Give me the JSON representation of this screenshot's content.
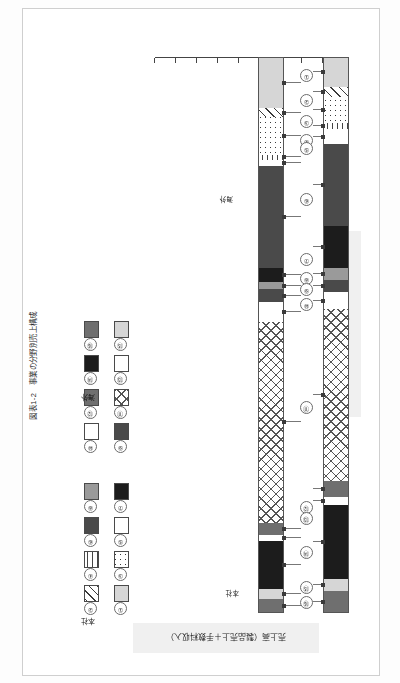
{
  "figure": {
    "caption": "図表1-2　事業の分野別売上構成",
    "axis_sales_label": "売上高（製品売上＋手数料収入）",
    "axis_employees_label": "従業員数"
  },
  "legend": {
    "group_headcourt_label": "本社",
    "group_overseas_label": "海外",
    "items": [
      {
        "num": "①",
        "pattern": "f-solidlight"
      },
      {
        "num": "②",
        "pattern": "f-diag"
      },
      {
        "num": "③",
        "pattern": "f-dots"
      },
      {
        "num": "④",
        "pattern": "f-hatchv"
      },
      {
        "num": "⑤",
        "pattern": "f-white"
      },
      {
        "num": "⑥",
        "pattern": "f-darkgray"
      },
      {
        "num": "⑦",
        "pattern": "f-solidblack"
      },
      {
        "num": "⑧",
        "pattern": "f-solidmid"
      },
      {
        "num": "⑨",
        "pattern": "f-darkgray"
      },
      {
        "num": "⑩",
        "pattern": "f-white"
      },
      {
        "num": "⑪",
        "pattern": "f-cross"
      },
      {
        "num": "⑫",
        "pattern": "f-solidgray"
      },
      {
        "num": "⑬",
        "pattern": "f-white"
      },
      {
        "num": "⑭",
        "pattern": "f-solidblack"
      },
      {
        "num": "⑮",
        "pattern": "f-solidlight"
      },
      {
        "num": "⑯",
        "pattern": "f-solidgray"
      }
    ]
  },
  "callouts": {
    "overseas_marker_label": "海外",
    "headoffice_marker_label": "本社"
  },
  "chart_data": {
    "type": "bar",
    "title": "図表1-2　事業の分野別売上構成",
    "orientation": "stacked-vertical-pair",
    "xlabel": "",
    "ylabel": "構成比（％）",
    "ylim": [
      0,
      100
    ],
    "grid": false,
    "legend_position": "right",
    "categories": [
      "売上高（製品売上＋手数料収入）",
      "従業員数"
    ],
    "annotations": [
      "本社",
      "海外"
    ],
    "series": [
      {
        "name": "①",
        "pattern": "f-solidlight",
        "values": [
          9.2,
          5.4
        ]
      },
      {
        "name": "②",
        "pattern": "f-diag",
        "values": [
          1.6,
          1.8
        ]
      },
      {
        "name": "③",
        "pattern": "f-dots",
        "values": [
          6.8,
          4.6
        ]
      },
      {
        "name": "④",
        "pattern": "f-hatchv",
        "values": [
          0.9,
          1.2
        ]
      },
      {
        "name": "⑤",
        "pattern": "f-white",
        "values": [
          1.1,
          2.6
        ]
      },
      {
        "name": "⑥",
        "pattern": "f-darkgray",
        "values": [
          18.4,
          14.8
        ]
      },
      {
        "name": "⑦",
        "pattern": "f-solidblack",
        "values": [
          2.4,
          7.6
        ]
      },
      {
        "name": "⑧",
        "pattern": "f-solidmid",
        "values": [
          1.4,
          2.2
        ]
      },
      {
        "name": "⑨",
        "pattern": "f-darkgray",
        "values": [
          2.2,
          2.0
        ]
      },
      {
        "name": "⑩",
        "pattern": "f-white",
        "values": [
          3.6,
          3.2
        ]
      },
      {
        "name": "⑪",
        "pattern": "f-cross",
        "values": [
          36.2,
          30.8
        ]
      },
      {
        "name": "⑫",
        "pattern": "f-solidgray",
        "values": [
          2.1,
          3.0
        ]
      },
      {
        "name": "⑬",
        "pattern": "f-white",
        "values": [
          1.2,
          1.4
        ]
      },
      {
        "name": "⑭",
        "pattern": "f-solidblack",
        "values": [
          8.6,
          13.2
        ]
      },
      {
        "name": "⑮",
        "pattern": "f-solidlight",
        "values": [
          1.8,
          2.2
        ]
      },
      {
        "name": "⑯",
        "pattern": "f-solidgray",
        "values": [
          2.5,
          4.0
        ]
      }
    ]
  }
}
